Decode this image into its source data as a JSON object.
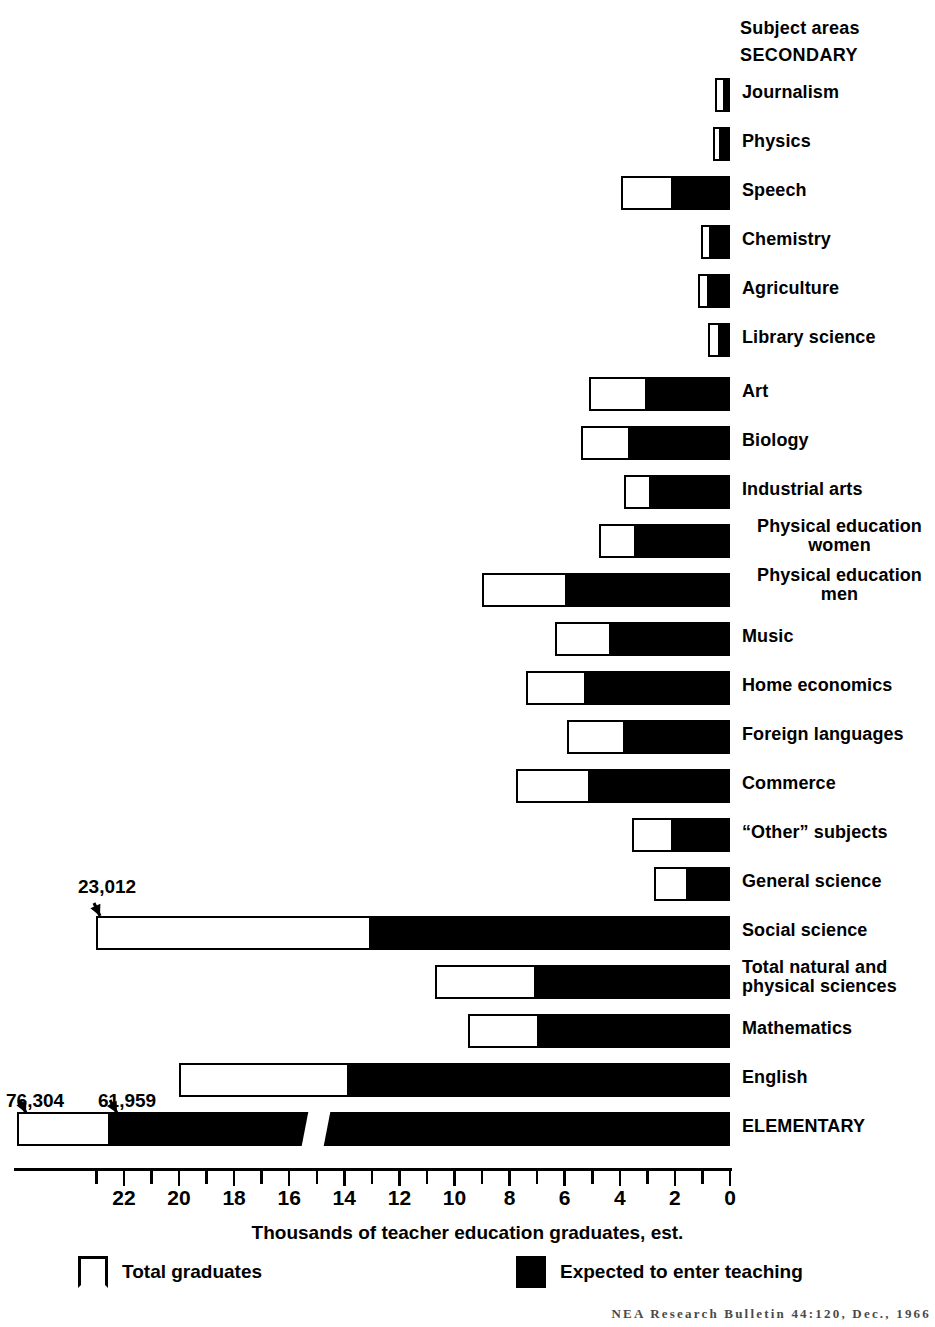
{
  "header": {
    "subject_areas": "Subject areas",
    "secondary": "SECONDARY"
  },
  "axis": {
    "title": "Thousands of teacher education graduates, est.",
    "tick_labels": [
      "22",
      "20",
      "18",
      "16",
      "14",
      "12",
      "10",
      "8",
      "6",
      "4",
      "2",
      "0"
    ],
    "direction": "right-to-left",
    "max": 24,
    "min": 0
  },
  "legend": {
    "total_label": "Total graduates",
    "filled_label": "Expected to enter teaching",
    "total_color": "#ffffff",
    "filled_color": "#000000"
  },
  "callouts": [
    {
      "value": "23,012",
      "row": "Social science"
    },
    {
      "value": "76,304",
      "row": "ELEMENTARY total"
    },
    {
      "value": "61,959",
      "row": "ELEMENTARY expected"
    }
  ],
  "source": "NEA Research Bulletin 44:120, Dec., 1966",
  "chart_data": {
    "type": "bar",
    "orientation": "horizontal-right-to-left",
    "xlabel": "Thousands of teacher education graduates, est.",
    "ylabel": "Subject areas",
    "xlim": [
      0,
      24
    ],
    "grid": false,
    "legend_position": "bottom",
    "series": [
      {
        "name": "Total graduates",
        "color": "#ffffff"
      },
      {
        "name": "Expected to enter teaching",
        "color": "#000000"
      }
    ],
    "categories": [
      "Journalism",
      "Physics",
      "Speech",
      "Chemistry",
      "Agriculture",
      "Library science",
      "Art",
      "Biology",
      "Industrial arts",
      "Physical education\nwomen",
      "Physical education\nmen",
      "Music",
      "Home economics",
      "Foreign languages",
      "Commerce",
      "“Other” subjects",
      "General science",
      "Social science",
      "Total natural and\nphysical sciences",
      "Mathematics",
      "English",
      "ELEMENTARY"
    ],
    "rows": [
      {
        "label": "Journalism",
        "total": 0.55,
        "expected": 0.25,
        "label_lines": 1
      },
      {
        "label": "Physics",
        "total": 0.6,
        "expected": 0.4,
        "label_lines": 1
      },
      {
        "label": "Speech",
        "total": 3.95,
        "expected": 2.15,
        "label_lines": 1
      },
      {
        "label": "Chemistry",
        "total": 1.05,
        "expected": 0.75,
        "label_lines": 1
      },
      {
        "label": "Agriculture",
        "total": 1.15,
        "expected": 0.85,
        "label_lines": 1
      },
      {
        "label": "Library science",
        "total": 0.8,
        "expected": 0.45,
        "label_lines": 1
      },
      {
        "label": "Art",
        "total": 5.1,
        "expected": 3.1,
        "label_lines": 1
      },
      {
        "label": "Biology",
        "total": 5.4,
        "expected": 3.7,
        "label_lines": 1
      },
      {
        "label": "Industrial arts",
        "total": 3.85,
        "expected": 2.95,
        "label_lines": 1
      },
      {
        "label": "Physical education\nwomen",
        "total": 4.75,
        "expected": 3.5,
        "label_lines": 2
      },
      {
        "label": "Physical education\nmen",
        "total": 9.0,
        "expected": 6.0,
        "label_lines": 2
      },
      {
        "label": "Music",
        "total": 6.35,
        "expected": 4.4,
        "label_lines": 1
      },
      {
        "label": "Home economics",
        "total": 7.4,
        "expected": 5.3,
        "label_lines": 1
      },
      {
        "label": "Foreign languages",
        "total": 5.9,
        "expected": 3.9,
        "label_lines": 1
      },
      {
        "label": "Commerce",
        "total": 7.75,
        "expected": 5.15,
        "label_lines": 1
      },
      {
        "label": "“Other” subjects",
        "total": 3.55,
        "expected": 2.15,
        "label_lines": 1
      },
      {
        "label": "General science",
        "total": 2.75,
        "expected": 1.6,
        "label_lines": 1
      },
      {
        "label": "Social science",
        "total": 23.012,
        "expected": 13.1,
        "label_lines": 1
      },
      {
        "label": "Total natural and\nphysical sciences",
        "total": 10.7,
        "expected": 7.1,
        "label_lines": 2
      },
      {
        "label": "Mathematics",
        "total": 9.5,
        "expected": 7.0,
        "label_lines": 1
      },
      {
        "label": "English",
        "total": 20.0,
        "expected": 13.9,
        "label_lines": 1
      },
      {
        "label": "ELEMENTARY",
        "total": 76.304,
        "expected": 61.959,
        "label_lines": 1,
        "broken_axis": true
      }
    ]
  }
}
